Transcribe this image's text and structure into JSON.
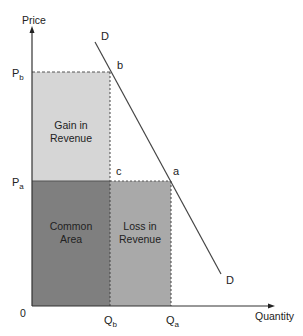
{
  "diagram": {
    "axes": {
      "y_label": "Price",
      "x_label": "Quantity",
      "origin_label": "0"
    },
    "price_levels": {
      "pb": {
        "main": "P",
        "sub": "b"
      },
      "pa": {
        "main": "P",
        "sub": "a"
      }
    },
    "quantity_levels": {
      "qb": {
        "main": "Q",
        "sub": "b"
      },
      "qa": {
        "main": "Q",
        "sub": "a"
      }
    },
    "demand_curve": {
      "top_label": "D",
      "bottom_label": "D"
    },
    "points": {
      "b": "b",
      "a": "a",
      "c": "c"
    },
    "regions": {
      "gain": {
        "line1": "Gain in",
        "line2": "Revenue",
        "color": "#d6d6d6"
      },
      "common": {
        "line1": "Common",
        "line2": "Area",
        "color": "#7f7f7f"
      },
      "loss": {
        "line1": "Loss in",
        "line2": "Revenue",
        "color": "#a9a9a9"
      }
    }
  }
}
